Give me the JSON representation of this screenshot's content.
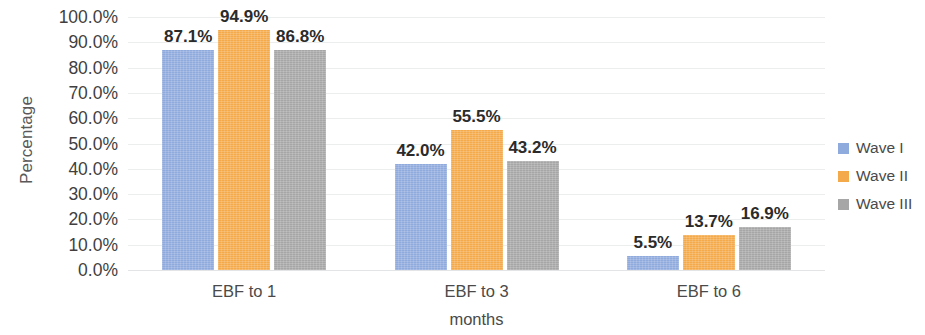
{
  "chart_data": {
    "type": "bar",
    "title": "",
    "xlabel": "months",
    "ylabel": "Percentage",
    "categories": [
      "EBF to 1",
      "EBF to 3",
      "EBF to 6"
    ],
    "series": [
      {
        "name": "Wave I",
        "color": "#8FAADC",
        "values": [
          87.1,
          42.0,
          5.5
        ],
        "labels": [
          "87.1%",
          "42.0%",
          "5.5%"
        ]
      },
      {
        "name": "Wave II",
        "color": "#F4A94A",
        "values": [
          94.9,
          55.5,
          13.7
        ],
        "labels": [
          "94.9%",
          "55.5%",
          "13.7%"
        ]
      },
      {
        "name": "Wave III",
        "color": "#A6A6A6",
        "values": [
          86.8,
          43.2,
          16.9
        ],
        "labels": [
          "86.8%",
          "43.2%",
          "16.9%"
        ]
      }
    ],
    "ylim": [
      0,
      100
    ],
    "ytick_labels": [
      "100.0%",
      "90.0%",
      "80.0%",
      "70.0%",
      "60.0%",
      "50.0%",
      "40.0%",
      "30.0%",
      "20.0%",
      "10.0%",
      "0.0%"
    ],
    "ytick_values": [
      100,
      90,
      80,
      70,
      60,
      50,
      40,
      30,
      20,
      10,
      0
    ],
    "grid": true,
    "legend_position": "right"
  },
  "legend": {
    "items": [
      {
        "label": "Wave I"
      },
      {
        "label": "Wave II"
      },
      {
        "label": "Wave III"
      }
    ]
  }
}
